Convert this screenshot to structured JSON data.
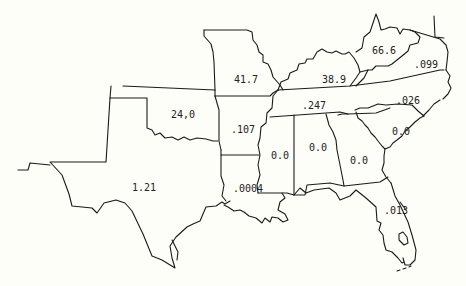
{
  "map": {
    "type": "choropleth-values",
    "region": "Southeastern United States",
    "states": [
      {
        "id": "oklahoma",
        "value": "24,0",
        "x": 171,
        "y": 110
      },
      {
        "id": "texas",
        "value": "1.21",
        "x": 132,
        "y": 183
      },
      {
        "id": "missouri",
        "value": "41.7",
        "x": 234,
        "y": 75
      },
      {
        "id": "arkansas",
        "value": ".107",
        "x": 231,
        "y": 125
      },
      {
        "id": "louisiana",
        "value": ".0004",
        "x": 233,
        "y": 184
      },
      {
        "id": "mississippi",
        "value": "0.0",
        "x": 271,
        "y": 151
      },
      {
        "id": "alabama",
        "value": "0.0",
        "x": 309,
        "y": 143
      },
      {
        "id": "georgia",
        "value": "0.0",
        "x": 350,
        "y": 156
      },
      {
        "id": "kentucky",
        "value": "38.9",
        "x": 322,
        "y": 75
      },
      {
        "id": "tennessee",
        "value": ".247",
        "x": 302,
        "y": 101
      },
      {
        "id": "west-virginia",
        "value": "66.6",
        "x": 372,
        "y": 46
      },
      {
        "id": "virginia",
        "value": ".099",
        "x": 414,
        "y": 60
      },
      {
        "id": "north-carolina",
        "value": ".026",
        "x": 396,
        "y": 96
      },
      {
        "id": "south-carolina",
        "value": "0.0",
        "x": 392,
        "y": 127
      },
      {
        "id": "florida",
        "value": ".013",
        "x": 384,
        "y": 206
      }
    ]
  }
}
